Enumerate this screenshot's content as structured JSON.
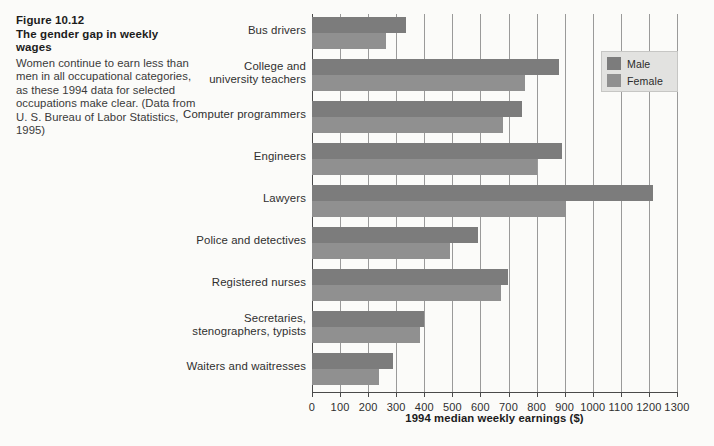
{
  "caption": {
    "figure_number": "Figure 10.12",
    "figure_title": "The gender gap in weekly wages",
    "body": "Women continue to earn less than men in all occupational categories, as these 1994 data for selected occupations make clear. (Data from U. S. Bureau of Labor Statistics, 1995)"
  },
  "legend": {
    "items": [
      {
        "label": "Male",
        "color": "#7c7c7c"
      },
      {
        "label": "Female",
        "color": "#909090"
      }
    ]
  },
  "chart_data": {
    "type": "bar",
    "orientation": "horizontal",
    "title": "The gender gap in weekly wages",
    "xlabel": "1994 median weekly earnings ($)",
    "ylabel": "",
    "xlim": [
      0,
      1300
    ],
    "xticks": [
      0,
      100,
      200,
      300,
      400,
      500,
      600,
      700,
      800,
      900,
      1000,
      1100,
      1200,
      1300
    ],
    "xticklabels": [
      "0",
      "100",
      "200",
      "300",
      "400",
      "500",
      "600",
      "700",
      "800",
      "900",
      "1000",
      "1100",
      "1200",
      "1300"
    ],
    "grid": "vertical",
    "legend_position": "top-right",
    "categories": [
      "Bus drivers",
      "College and\nuniversity teachers",
      "Computer programmers",
      "Engineers",
      "Lawyers",
      "Police and detectives",
      "Registered nurses",
      "Secretaries,\nstenographers, typists",
      "Waiters and waitresses"
    ],
    "series": [
      {
        "name": "Male",
        "color": "#7c7c7c",
        "values": [
          335,
          880,
          748,
          890,
          1214,
          591,
          698,
          399,
          288
        ]
      },
      {
        "name": "Female",
        "color": "#909090",
        "values": [
          263,
          758,
          680,
          801,
          905,
          491,
          673,
          385,
          239
        ]
      }
    ]
  }
}
